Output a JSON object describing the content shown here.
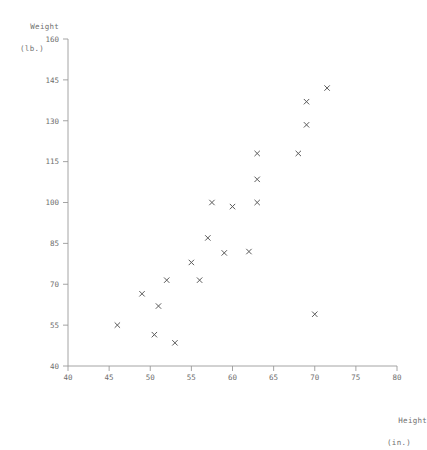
{
  "chart_data": {
    "type": "scatter",
    "title": "",
    "xlabel": "Height",
    "xlabel_units": "(in.)",
    "ylabel": "Weight",
    "ylabel_units": "(lb.)",
    "xlim": [
      40,
      80
    ],
    "ylim": [
      40,
      160
    ],
    "xticks": [
      40,
      45,
      50,
      55,
      60,
      65,
      70,
      75,
      80
    ],
    "yticks": [
      40,
      55,
      70,
      85,
      100,
      115,
      130,
      145,
      160
    ],
    "grid": false,
    "legend": "none",
    "marker": "x",
    "marker_color": "#5a5a5a",
    "axis_color": "#9a9a9a",
    "points": [
      {
        "x": 46.0,
        "y": 55.0
      },
      {
        "x": 49.0,
        "y": 66.5
      },
      {
        "x": 50.5,
        "y": 51.5
      },
      {
        "x": 51.0,
        "y": 62.0
      },
      {
        "x": 52.0,
        "y": 71.5
      },
      {
        "x": 53.0,
        "y": 48.5
      },
      {
        "x": 55.0,
        "y": 78.0
      },
      {
        "x": 56.0,
        "y": 71.5
      },
      {
        "x": 57.0,
        "y": 87.0
      },
      {
        "x": 57.5,
        "y": 100.0
      },
      {
        "x": 59.0,
        "y": 81.5
      },
      {
        "x": 60.0,
        "y": 98.5
      },
      {
        "x": 62.0,
        "y": 82.0
      },
      {
        "x": 63.0,
        "y": 100.0
      },
      {
        "x": 63.0,
        "y": 108.5
      },
      {
        "x": 63.0,
        "y": 118.0
      },
      {
        "x": 68.0,
        "y": 118.0
      },
      {
        "x": 69.0,
        "y": 128.5
      },
      {
        "x": 69.0,
        "y": 137.0
      },
      {
        "x": 70.0,
        "y": 59.0
      },
      {
        "x": 71.5,
        "y": 142.0
      }
    ]
  },
  "axes": {
    "x_tick_labels": [
      "40",
      "45",
      "50",
      "55",
      "60",
      "65",
      "70",
      "75",
      "80"
    ],
    "y_tick_labels": [
      "40",
      "55",
      "70",
      "85",
      "100",
      "115",
      "130",
      "145",
      "160"
    ]
  }
}
